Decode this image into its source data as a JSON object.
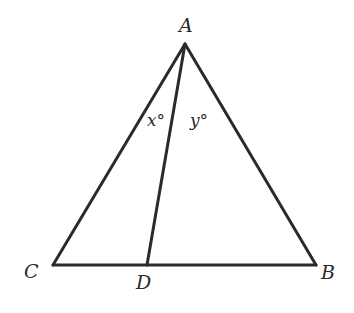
{
  "diagram": {
    "type": "geometry-triangle",
    "stroke_color": "#2a2a2a",
    "text_color": "#2a2a2a",
    "vertices": [
      {
        "id": "A",
        "label": "A",
        "x": 185,
        "y": 44
      },
      {
        "id": "B",
        "label": "B",
        "x": 316,
        "y": 265
      },
      {
        "id": "C",
        "label": "C",
        "x": 53,
        "y": 265
      },
      {
        "id": "D",
        "label": "D",
        "x": 147,
        "y": 265
      }
    ],
    "segments": [
      {
        "from": "A",
        "to": "B"
      },
      {
        "from": "A",
        "to": "C"
      },
      {
        "from": "C",
        "to": "B"
      },
      {
        "from": "A",
        "to": "D"
      }
    ],
    "angle_labels": [
      {
        "id": "x",
        "text": "x°",
        "meaning": "angle CAD"
      },
      {
        "id": "y",
        "text": "y°",
        "meaning": "angle DAB"
      }
    ]
  }
}
